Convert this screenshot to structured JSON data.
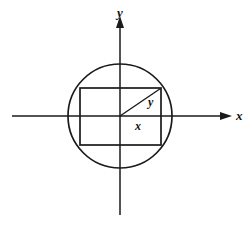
{
  "figure": {
    "background_color": "#ffffff",
    "stroke_color": "#1a1a1a",
    "axes": {
      "x_axis_label": "x",
      "y_axis_label": "y",
      "x_axis": {
        "x1": 12,
        "y1": 116,
        "x2": 228,
        "y2": 116,
        "arrow": "right"
      },
      "y_axis": {
        "x1": 120,
        "y1": 215,
        "x2": 120,
        "y2": 18,
        "arrow": "up"
      },
      "origin": {
        "x": 120,
        "y": 116
      }
    },
    "circle": {
      "center_x": 120,
      "center_y": 116,
      "radius": 52,
      "stroke_width": 1.6
    },
    "rectangle": {
      "left": 80,
      "top": 88,
      "right": 161,
      "bottom": 145,
      "width": 81,
      "height": 57,
      "stroke_width": 1.6
    },
    "radius_segment": {
      "x1": 120,
      "y1": 116,
      "x2": 161,
      "y2": 88,
      "stroke_width": 1.3
    },
    "labels": {
      "radius_vertical": "y",
      "radius_horizontal": "x"
    }
  }
}
